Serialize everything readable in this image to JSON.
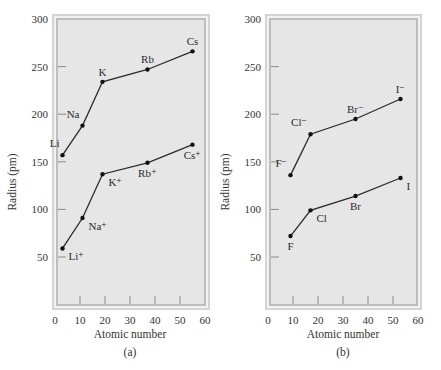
{
  "chart_data": [
    {
      "id": "a",
      "type": "line",
      "caption": "(a)",
      "xlabel": "Atomic number",
      "ylabel": "Radius (pm)",
      "xlim": [
        0,
        60
      ],
      "ylim": [
        0,
        300
      ],
      "xticks": [
        0,
        10,
        20,
        30,
        40,
        50,
        60
      ],
      "yticks": [
        50,
        100,
        150,
        200,
        250,
        300
      ],
      "grid": false,
      "series": [
        {
          "name": "Alkali metal atoms",
          "points": [
            {
              "label": "Li",
              "x": 3,
              "y": 157,
              "label_pos": "left-up"
            },
            {
              "label": "Na",
              "x": 11,
              "y": 188,
              "label_pos": "left-up"
            },
            {
              "label": "K",
              "x": 19,
              "y": 234,
              "label_pos": "up"
            },
            {
              "label": "Rb",
              "x": 37,
              "y": 247,
              "label_pos": "up"
            },
            {
              "label": "Cs",
              "x": 55,
              "y": 266,
              "label_pos": "up"
            }
          ]
        },
        {
          "name": "Alkali metal cations",
          "points": [
            {
              "label": "Li⁺",
              "x": 3,
              "y": 59,
              "label_pos": "right-down"
            },
            {
              "label": "Na⁺",
              "x": 11,
              "y": 91,
              "label_pos": "right-down"
            },
            {
              "label": "K⁺",
              "x": 19,
              "y": 137,
              "label_pos": "right-down"
            },
            {
              "label": "Rb⁺",
              "x": 37,
              "y": 149,
              "label_pos": "down"
            },
            {
              "label": "Cs⁺",
              "x": 55,
              "y": 168,
              "label_pos": "down"
            }
          ]
        }
      ]
    },
    {
      "id": "b",
      "type": "line",
      "caption": "(b)",
      "xlabel": "Atomic number",
      "ylabel": "Radius (pm)",
      "xlim": [
        0,
        60
      ],
      "ylim": [
        0,
        300
      ],
      "xticks": [
        0,
        10,
        20,
        30,
        40,
        50,
        60
      ],
      "yticks": [
        50,
        100,
        150,
        200,
        250,
        300
      ],
      "grid": false,
      "series": [
        {
          "name": "Halide anions",
          "points": [
            {
              "label": "F⁻",
              "x": 9,
              "y": 136,
              "label_pos": "left-up"
            },
            {
              "label": "Cl⁻",
              "x": 17,
              "y": 179,
              "label_pos": "left-up"
            },
            {
              "label": "Br⁻",
              "x": 35,
              "y": 195,
              "label_pos": "up"
            },
            {
              "label": "I⁻",
              "x": 53,
              "y": 216,
              "label_pos": "up"
            }
          ]
        },
        {
          "name": "Halogen atoms",
          "points": [
            {
              "label": "F",
              "x": 9,
              "y": 72,
              "label_pos": "down"
            },
            {
              "label": "Cl",
              "x": 17,
              "y": 99,
              "label_pos": "right-down"
            },
            {
              "label": "Br",
              "x": 35,
              "y": 114,
              "label_pos": "down"
            },
            {
              "label": "I",
              "x": 53,
              "y": 133,
              "label_pos": "right-down"
            }
          ]
        }
      ]
    }
  ],
  "colors": {
    "plot_background": "#e6e6e6",
    "frame_outer": "#d4d4d4",
    "frame_inner": "#bdbdbd",
    "line": "#2b2b2b",
    "tick": "#8a8a8a"
  }
}
